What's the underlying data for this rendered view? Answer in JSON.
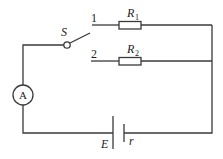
{
  "diagram": {
    "type": "circuit",
    "components": {
      "switch": {
        "label": "S"
      },
      "terminal_1": {
        "label": "1"
      },
      "terminal_2": {
        "label": "2"
      },
      "resistor_1": {
        "label": "R",
        "subscript": "1"
      },
      "resistor_2": {
        "label": "R",
        "subscript": "2"
      },
      "ammeter": {
        "label": "A"
      },
      "battery": {
        "emf_label": "E",
        "internal_resistance_label": "r"
      }
    },
    "colors": {
      "line": "#3a3a3a",
      "background": "#ffffff"
    }
  }
}
